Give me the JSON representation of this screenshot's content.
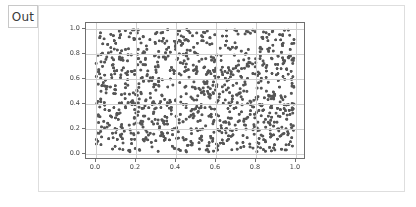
{
  "prompt": {
    "label": "Out"
  },
  "output_cell": {
    "background_color": "#ffffff",
    "border_color": "#dedede"
  },
  "chart_data": {
    "type": "scatter",
    "title": "",
    "xlabel": "",
    "ylabel": "",
    "xlim": [
      -0.05,
      1.05
    ],
    "ylim": [
      -0.05,
      1.05
    ],
    "xticks": [
      0.0,
      0.2,
      0.4,
      0.6,
      0.8,
      1.0
    ],
    "yticks": [
      0.0,
      0.2,
      0.4,
      0.6,
      0.8,
      1.0
    ],
    "xticklabels": [
      "0.0",
      "0.2",
      "0.4",
      "0.6",
      "0.8",
      "1.0"
    ],
    "yticklabels": [
      "0.0",
      "0.2",
      "0.4",
      "0.6",
      "0.8",
      "1.0"
    ],
    "grid": true,
    "grid_color": "#cfcfcf",
    "frame_color": "#6f6f6f",
    "legend": null,
    "series": [
      {
        "name": "random uniform points",
        "marker": "circle",
        "marker_color": "#555555",
        "marker_size": 3,
        "n_points": 1000,
        "distribution": "uniform",
        "x_range": [
          0.0,
          1.0
        ],
        "y_range": [
          0.0,
          1.0
        ],
        "description": "1000 points drawn uniformly at random from the unit square"
      }
    ]
  }
}
